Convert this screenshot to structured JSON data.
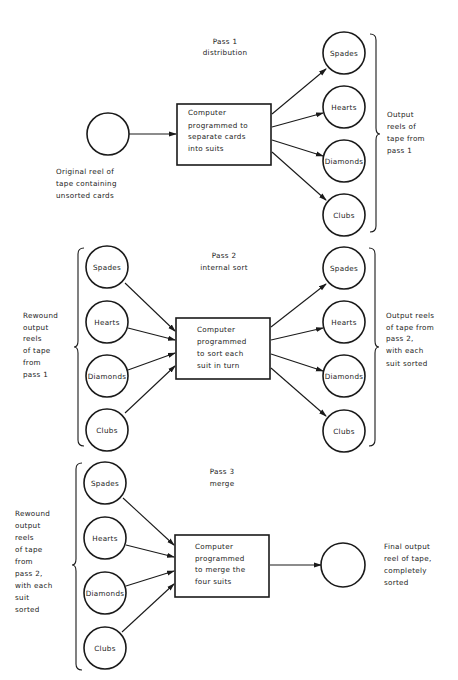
{
  "pass1": {
    "title": "Pass 1",
    "subtitle": "distribution",
    "input_reel_label": [
      "Original reel of",
      "tape containing",
      "unsorted cards"
    ],
    "computer_box": [
      "Computer",
      "programmed to",
      "separate cards",
      "into suits"
    ],
    "outputs": [
      "Spades",
      "Hearts",
      "Diamonds",
      "Clubs"
    ],
    "output_label": [
      "Output",
      "reels of",
      "tape from",
      "pass 1"
    ]
  },
  "pass2": {
    "title": "Pass 2",
    "subtitle": "internal sort",
    "inputs": [
      "Spades",
      "Hearts",
      "Diamonds",
      "Clubs"
    ],
    "input_label": [
      "Rewound",
      "output",
      "reels",
      "of tape",
      "from",
      "pass 1"
    ],
    "computer_box": [
      "Computer",
      "programmed",
      "to sort each",
      "suit in turn"
    ],
    "outputs": [
      "Spades",
      "Hearts",
      "Diamonds",
      "Clubs"
    ],
    "output_label": [
      "Output reels",
      "of tape from",
      "pass 2,",
      "with each",
      "suit sorted"
    ]
  },
  "pass3": {
    "title": "Pass 3",
    "subtitle": "merge",
    "inputs": [
      "Spades",
      "Hearts",
      "Diamonds",
      "Clubs"
    ],
    "input_label": [
      "Rewound",
      "output",
      "reels",
      "of tape",
      "from",
      "pass 2,",
      "with each",
      "suit",
      "sorted"
    ],
    "computer_box": [
      "Computer",
      "programmed",
      "to merge the",
      "four suits"
    ],
    "final_label": [
      "Final output",
      "reel of tape,",
      "completely",
      "sorted"
    ]
  }
}
